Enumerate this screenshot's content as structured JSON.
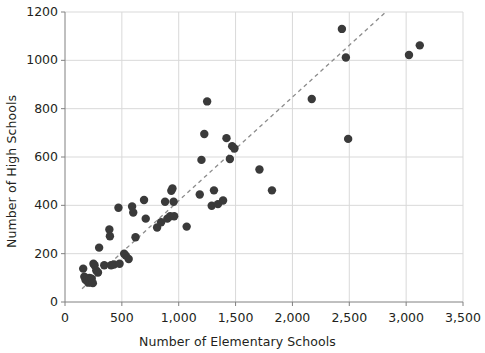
{
  "chart_data": {
    "type": "scatter",
    "title": "",
    "xlabel": "Number of Elementary Schools",
    "ylabel": "Number of High Schools",
    "xlim": [
      0,
      3500
    ],
    "ylim": [
      0,
      1200
    ],
    "xticks": [
      0,
      500,
      1000,
      1500,
      2000,
      2500,
      3000,
      3500
    ],
    "xtick_labels": [
      "0",
      "500",
      "1,000",
      "1,500",
      "2,000",
      "2,500",
      "3,000",
      "3,500"
    ],
    "yticks": [
      0,
      200,
      400,
      600,
      800,
      1000,
      1200
    ],
    "ytick_labels": [
      "0",
      "200",
      "400",
      "600",
      "800",
      "1000",
      "1200"
    ],
    "grid": true,
    "grid_color": "#d9d9d9",
    "axis_color": "#808080",
    "marker_color": "#3a3a3a",
    "marker_size": 4.2,
    "legend": null,
    "trendline": {
      "style": "dashed",
      "color": "#8c8c8c",
      "x_start": 150,
      "y_start": 55,
      "x_end": 2810,
      "y_end": 1195
    },
    "points": [
      {
        "x": 160,
        "y": 138
      },
      {
        "x": 170,
        "y": 105
      },
      {
        "x": 180,
        "y": 92
      },
      {
        "x": 195,
        "y": 88
      },
      {
        "x": 205,
        "y": 80
      },
      {
        "x": 215,
        "y": 100
      },
      {
        "x": 225,
        "y": 82
      },
      {
        "x": 235,
        "y": 96
      },
      {
        "x": 245,
        "y": 78
      },
      {
        "x": 250,
        "y": 158
      },
      {
        "x": 260,
        "y": 152
      },
      {
        "x": 275,
        "y": 130
      },
      {
        "x": 290,
        "y": 122
      },
      {
        "x": 300,
        "y": 225
      },
      {
        "x": 345,
        "y": 152
      },
      {
        "x": 390,
        "y": 300
      },
      {
        "x": 395,
        "y": 272
      },
      {
        "x": 405,
        "y": 152
      },
      {
        "x": 430,
        "y": 155
      },
      {
        "x": 470,
        "y": 390
      },
      {
        "x": 480,
        "y": 158
      },
      {
        "x": 520,
        "y": 200
      },
      {
        "x": 535,
        "y": 192
      },
      {
        "x": 560,
        "y": 178
      },
      {
        "x": 590,
        "y": 395
      },
      {
        "x": 600,
        "y": 370
      },
      {
        "x": 620,
        "y": 268
      },
      {
        "x": 695,
        "y": 422
      },
      {
        "x": 710,
        "y": 345
      },
      {
        "x": 810,
        "y": 308
      },
      {
        "x": 845,
        "y": 330
      },
      {
        "x": 880,
        "y": 415
      },
      {
        "x": 900,
        "y": 345
      },
      {
        "x": 925,
        "y": 355
      },
      {
        "x": 935,
        "y": 460
      },
      {
        "x": 945,
        "y": 470
      },
      {
        "x": 955,
        "y": 415
      },
      {
        "x": 960,
        "y": 355
      },
      {
        "x": 1070,
        "y": 312
      },
      {
        "x": 1185,
        "y": 445
      },
      {
        "x": 1200,
        "y": 588
      },
      {
        "x": 1225,
        "y": 695
      },
      {
        "x": 1250,
        "y": 830
      },
      {
        "x": 1290,
        "y": 398
      },
      {
        "x": 1310,
        "y": 462
      },
      {
        "x": 1345,
        "y": 405
      },
      {
        "x": 1390,
        "y": 420
      },
      {
        "x": 1420,
        "y": 678
      },
      {
        "x": 1450,
        "y": 592
      },
      {
        "x": 1470,
        "y": 645
      },
      {
        "x": 1490,
        "y": 635
      },
      {
        "x": 1710,
        "y": 548
      },
      {
        "x": 1820,
        "y": 462
      },
      {
        "x": 2170,
        "y": 840
      },
      {
        "x": 2435,
        "y": 1130
      },
      {
        "x": 2470,
        "y": 1012
      },
      {
        "x": 2490,
        "y": 675
      },
      {
        "x": 3025,
        "y": 1022
      },
      {
        "x": 3120,
        "y": 1062
      }
    ]
  }
}
